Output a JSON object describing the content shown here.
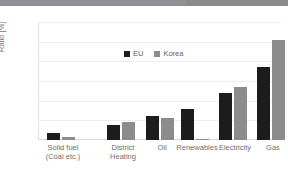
{
  "chart_data": {
    "type": "bar",
    "title": "",
    "xlabel": "",
    "ylabel": "Ratio [%]",
    "ylim": [
      0,
      60
    ],
    "yticks": [
      "0",
      "10",
      "20",
      "30",
      "40",
      "50",
      "60"
    ],
    "grid": true,
    "legend_position": "top-left-inside",
    "categories": [
      "Solid fuel\n(Coal etc.)",
      "District\nHeating",
      "Oil",
      "Renewables",
      "Electricity",
      "Gas"
    ],
    "category_labels": [
      {
        "line1": "Solid fuel",
        "line2": "(Coal etc.)"
      },
      {
        "line1": "District",
        "line2": "Heating"
      },
      {
        "line1": "Oil",
        "line2": ""
      },
      {
        "line1": "Renewables",
        "line2": ""
      },
      {
        "line1": "Electricity",
        "line2": ""
      },
      {
        "line1": "Gas",
        "line2": ""
      }
    ],
    "series": [
      {
        "name": "EU",
        "color": "#1c1c1c",
        "values": [
          3.5,
          7.5,
          12,
          16,
          24,
          37
        ]
      },
      {
        "name": "Korea",
        "color": "#8c8c8c",
        "values": [
          1.5,
          9,
          11,
          0.5,
          27,
          51
        ]
      }
    ]
  },
  "legend": {
    "items": [
      {
        "label": "EU",
        "color": "#1c1c1c"
      },
      {
        "label": "Korea",
        "color": "#8c8c8c"
      }
    ]
  }
}
